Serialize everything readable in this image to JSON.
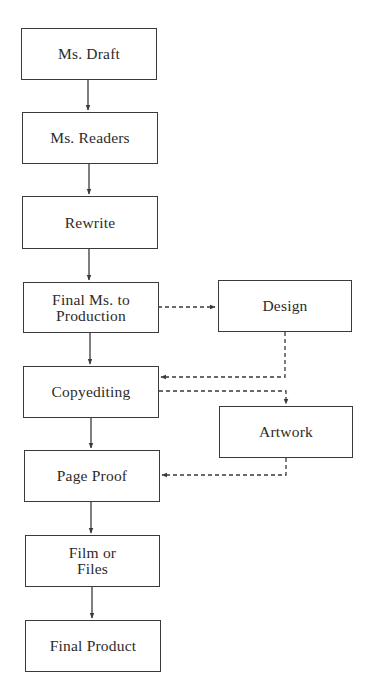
{
  "diagram": {
    "type": "flowchart",
    "nodes": [
      {
        "id": "ms_draft",
        "label": "Ms. Draft"
      },
      {
        "id": "ms_readers",
        "label": "Ms. Readers"
      },
      {
        "id": "rewrite",
        "label": "Rewrite"
      },
      {
        "id": "final_ms",
        "label_line1": "Final Ms. to",
        "label_line2": "Production"
      },
      {
        "id": "copyediting",
        "label": "Copyediting"
      },
      {
        "id": "page_proof",
        "label": "Page Proof"
      },
      {
        "id": "film_files",
        "label_line1": "Film or",
        "label_line2": "Files"
      },
      {
        "id": "final_product",
        "label": "Final Product"
      },
      {
        "id": "design",
        "label": "Design"
      },
      {
        "id": "artwork",
        "label": "Artwork"
      }
    ],
    "edges": [
      {
        "from": "Ms. Draft",
        "to": "Ms. Readers",
        "style": "solid"
      },
      {
        "from": "Ms. Readers",
        "to": "Rewrite",
        "style": "solid"
      },
      {
        "from": "Rewrite",
        "to": "Final Ms. to Production",
        "style": "solid"
      },
      {
        "from": "Final Ms. to Production",
        "to": "Copyediting",
        "style": "solid"
      },
      {
        "from": "Copyediting",
        "to": "Page Proof",
        "style": "solid"
      },
      {
        "from": "Page Proof",
        "to": "Film or Files",
        "style": "solid"
      },
      {
        "from": "Film or Files",
        "to": "Final Product",
        "style": "solid"
      },
      {
        "from": "Final Ms. to Production",
        "to": "Design",
        "style": "dashed"
      },
      {
        "from": "Design",
        "to": "Copyediting",
        "style": "dashed"
      },
      {
        "from": "Copyediting",
        "to": "Artwork",
        "style": "dashed"
      },
      {
        "from": "Artwork",
        "to": "Page Proof",
        "style": "dashed"
      }
    ]
  },
  "colors": {
    "line": "#3a3a3a",
    "background": "#ffffff",
    "text": "#2b2b2b"
  }
}
